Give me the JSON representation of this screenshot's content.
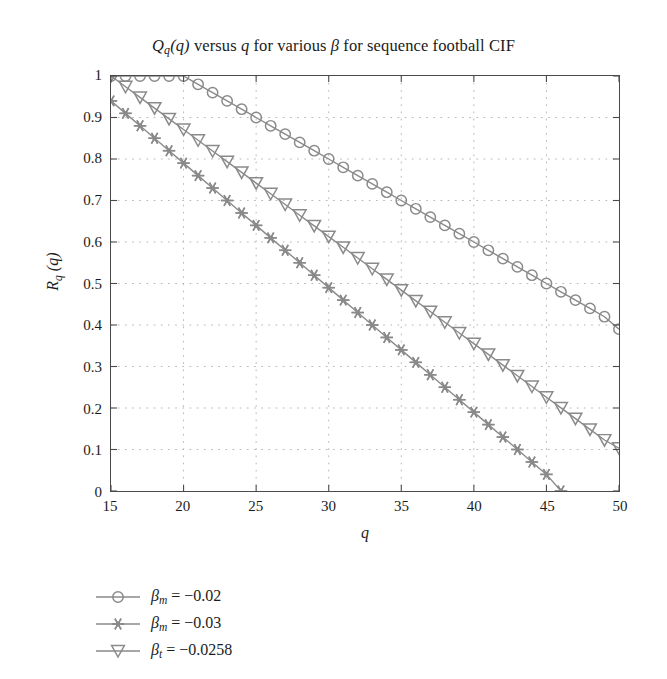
{
  "chart_data": {
    "type": "line",
    "title": "Qq(q) versus q for various β for sequence football CIF",
    "title_parts": {
      "q_main": "Q",
      "q_sub": "q",
      "arg": "(q)",
      "versus": " versus ",
      "q_var": "q",
      "mid": " for various ",
      "beta": "β",
      "tail": " for sequence football CIF"
    },
    "xlabel": "q",
    "ylabel": "Rq (q)",
    "ylabel_parts": {
      "main": "R",
      "sub": "q",
      "arg": " (q)"
    },
    "xlim": [
      15,
      50
    ],
    "ylim": [
      0,
      1
    ],
    "xticks": [
      15,
      20,
      25,
      30,
      35,
      40,
      45,
      50
    ],
    "xtick_labels": [
      "15",
      "20",
      "25",
      "30",
      "35",
      "40",
      "45",
      "50"
    ],
    "yticks": [
      0,
      0.1,
      0.2,
      0.3,
      0.4,
      0.5,
      0.6,
      0.7,
      0.8,
      0.9,
      1
    ],
    "ytick_labels": [
      "0",
      "0.1",
      "0.2",
      "0.3",
      "0.4",
      "0.5",
      "0.6",
      "0.7",
      "0.8",
      "0.9",
      "1"
    ],
    "grid": true,
    "grid_style": "dotted",
    "legend_position": "below-left",
    "line_color": "#8a8a8a",
    "grid_color": "#b9b9b9",
    "axis_color": "#4a4a4a",
    "series": [
      {
        "name": "βm = −0.02",
        "name_parts": {
          "beta": "β",
          "sub": "m",
          "eq": " = ",
          "value": "−0.02"
        },
        "marker": "circle",
        "x": [
          15,
          16,
          17,
          18,
          19,
          20,
          21,
          22,
          23,
          24,
          25,
          26,
          27,
          28,
          29,
          30,
          31,
          32,
          33,
          34,
          35,
          36,
          37,
          38,
          39,
          40,
          41,
          42,
          43,
          44,
          45,
          46,
          47,
          48,
          49,
          50
        ],
        "values": [
          1,
          1,
          1,
          1,
          1,
          1,
          0.98,
          0.96,
          0.94,
          0.92,
          0.9,
          0.88,
          0.86,
          0.84,
          0.82,
          0.8,
          0.78,
          0.76,
          0.74,
          0.72,
          0.7,
          0.68,
          0.66,
          0.64,
          0.62,
          0.6,
          0.58,
          0.56,
          0.54,
          0.52,
          0.5,
          0.48,
          0.46,
          0.44,
          0.42,
          0.39
        ]
      },
      {
        "name": "βm = −0.03",
        "name_parts": {
          "beta": "β",
          "sub": "m",
          "eq": " = ",
          "value": "−0.03"
        },
        "marker": "star",
        "x": [
          15,
          16,
          17,
          18,
          19,
          20,
          21,
          22,
          23,
          24,
          25,
          26,
          27,
          28,
          29,
          30,
          31,
          32,
          33,
          34,
          35,
          36,
          37,
          38,
          39,
          40,
          41,
          42,
          43,
          44,
          45,
          46
        ],
        "values": [
          0.94,
          0.91,
          0.88,
          0.85,
          0.82,
          0.79,
          0.76,
          0.73,
          0.7,
          0.67,
          0.64,
          0.61,
          0.58,
          0.55,
          0.52,
          0.49,
          0.46,
          0.43,
          0.4,
          0.37,
          0.34,
          0.31,
          0.28,
          0.25,
          0.22,
          0.19,
          0.16,
          0.13,
          0.1,
          0.07,
          0.04,
          0
        ]
      },
      {
        "name": "βt = −0.0258",
        "name_parts": {
          "beta": "β",
          "sub": "t",
          "eq": " = ",
          "value": "−0.0258"
        },
        "marker": "triangle-down",
        "x": [
          15,
          16,
          17,
          18,
          19,
          20,
          21,
          22,
          23,
          24,
          25,
          26,
          27,
          28,
          29,
          30,
          31,
          32,
          33,
          34,
          35,
          36,
          37,
          38,
          39,
          40,
          41,
          42,
          43,
          44,
          45,
          46,
          47,
          48,
          49,
          50
        ],
        "values": [
          1,
          0.9742,
          0.9484,
          0.9226,
          0.8968,
          0.871,
          0.8452,
          0.8194,
          0.7936,
          0.7678,
          0.742,
          0.7162,
          0.6904,
          0.6646,
          0.6388,
          0.613,
          0.5872,
          0.5614,
          0.5356,
          0.5098,
          0.484,
          0.4582,
          0.4324,
          0.4066,
          0.3808,
          0.355,
          0.3292,
          0.3034,
          0.2776,
          0.2518,
          0.226,
          0.2002,
          0.1744,
          0.1486,
          0.1228,
          0.103
        ]
      }
    ]
  }
}
